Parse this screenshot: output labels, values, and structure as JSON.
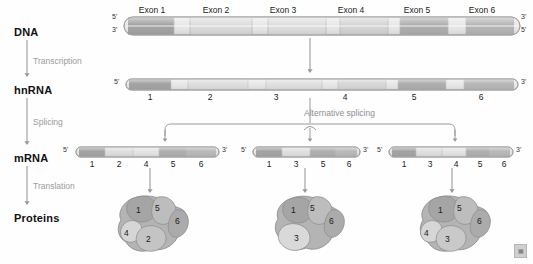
{
  "stages": [
    {
      "id": "dna",
      "label": "DNA",
      "y": 26
    },
    {
      "id": "hnrna",
      "label": "hnRNA",
      "y": 84
    },
    {
      "id": "mrna",
      "label": "mRNA",
      "y": 152
    },
    {
      "id": "proteins",
      "label": "Proteins",
      "y": 212
    }
  ],
  "processes": [
    {
      "id": "transcription",
      "label": "Transcription",
      "y": 56
    },
    {
      "id": "splicing",
      "label": "Splicing",
      "y": 117
    },
    {
      "id": "translation",
      "label": "Translation",
      "y": 181
    }
  ],
  "alternative_splicing": {
    "label": "Alternative splicing"
  },
  "dna": {
    "five_prime_left": "5'",
    "three_prime_left": "3'",
    "three_prime_right": "3'",
    "five_prime_right": "5'",
    "exon_labels": [
      "Exon 1",
      "Exon 2",
      "Exon 3",
      "Exon 4",
      "Exon 5",
      "Exon 6"
    ]
  },
  "hnrna": {
    "five_prime": "5'",
    "three_prime": "3'",
    "segments": [
      "1",
      "2",
      "3",
      "4",
      "5",
      "6"
    ]
  },
  "mrna_variants": [
    {
      "id": "variant-1",
      "five_prime": "5'",
      "three_prime": "3'",
      "exons": [
        "1",
        "2",
        "4",
        "5",
        "6"
      ]
    },
    {
      "id": "variant-2",
      "five_prime": "5'",
      "three_prime": "3'",
      "exons": [
        "1",
        "3",
        "5",
        "6"
      ]
    },
    {
      "id": "variant-3",
      "five_prime": "5'",
      "three_prime": "3'",
      "exons": [
        "1",
        "3",
        "4",
        "5",
        "6"
      ]
    }
  ],
  "proteins": [
    {
      "id": "protein-1",
      "domains": [
        "1",
        "5",
        "6",
        "4",
        "2"
      ]
    },
    {
      "id": "protein-2",
      "domains": [
        "1",
        "5",
        "6",
        "3"
      ]
    },
    {
      "id": "protein-3",
      "domains": [
        "1",
        "5",
        "6",
        "4",
        "3"
      ]
    }
  ],
  "watermark": {
    "label": "▦"
  },
  "colors": {
    "exon_dark": "#9a9a9a",
    "exon_mid": "#b9b9b9",
    "intron_light": "#e6e6e6",
    "strand_outline": "#9d9d9d",
    "arrow": "#9a9a9a",
    "text": "#111111",
    "process_text": "#9b9b9b",
    "protein_fill": "#b0b0b0",
    "protein_light": "#d3d3d3",
    "protein_dark": "#9a9a9a"
  }
}
